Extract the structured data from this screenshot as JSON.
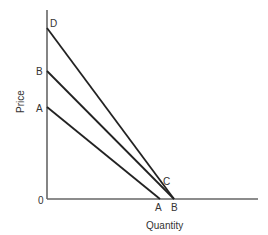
{
  "diagram": {
    "axes": {
      "y_label": "Price",
      "x_label": "Quantity",
      "origin_label": "0"
    },
    "curves": [
      {
        "name": "D",
        "start_label": "D",
        "from": [
          47,
          28
        ],
        "to": [
          174,
          199
        ]
      },
      {
        "name": "B",
        "start_label": "B",
        "end_label": "B",
        "from": [
          47,
          71
        ],
        "to": [
          174,
          199
        ]
      },
      {
        "name": "A",
        "start_label": "A",
        "end_label": "A",
        "from": [
          47,
          107
        ],
        "to": [
          160,
          199
        ]
      }
    ],
    "points": {
      "D_top": "D",
      "B_top": "B",
      "A_top": "A",
      "C_intersection": "C",
      "A_bottom": "A",
      "B_bottom": "B"
    }
  }
}
